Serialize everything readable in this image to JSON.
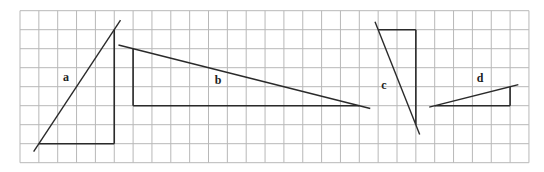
{
  "grid": {
    "columns": 27,
    "rows": 8,
    "line_color": "#b8b8b8"
  },
  "colors": {
    "stroke": "#2a2a2a",
    "label": "#222222"
  },
  "triangles": [
    {
      "id": "a",
      "label": "a",
      "right_angle": [
        5,
        7
      ],
      "horizontal_leg_to": [
        1,
        7
      ],
      "vertical_leg_to": [
        5,
        1
      ],
      "run": 4,
      "rise": 6
    },
    {
      "id": "b",
      "label": "b",
      "right_angle": [
        6,
        5
      ],
      "horizontal_leg_to": [
        18,
        5
      ],
      "vertical_leg_to": [
        6,
        2
      ],
      "run": 12,
      "rise": 3
    },
    {
      "id": "c",
      "label": "c",
      "right_angle": [
        21,
        1
      ],
      "horizontal_leg_to": [
        19,
        1
      ],
      "vertical_leg_to": [
        21,
        6
      ],
      "run": 2,
      "rise": 5
    },
    {
      "id": "d",
      "label": "d",
      "right_angle": [
        26,
        5
      ],
      "horizontal_leg_to": [
        22,
        5
      ],
      "vertical_leg_to": [
        26,
        4
      ],
      "run": 4,
      "rise": 1
    }
  ]
}
